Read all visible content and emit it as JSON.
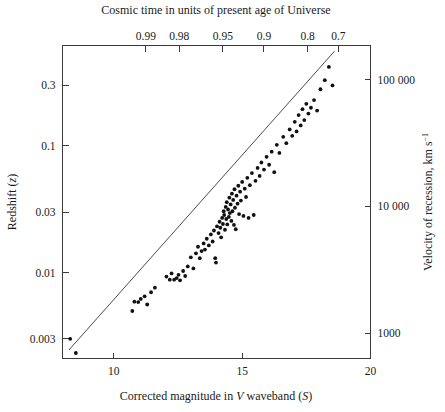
{
  "figure": {
    "width": 445,
    "height": 412,
    "background": "#ffffff",
    "point_color": "#111111",
    "line_color": "#4a4a4a",
    "axis_color": "#3a3a3a"
  },
  "chart_data": {
    "type": "scatter",
    "title": "",
    "top_axis_title": "Cosmic time in units of present age of Universe",
    "xlabel_parts": {
      "pre": "Corrected magnitude in ",
      "italic1": "V",
      "mid": " waveband (",
      "italic2": "S",
      "post": ")"
    },
    "xlabel": "Corrected magnitude in V waveband (S)",
    "ylabel_parts": {
      "pre": "Redshift (",
      "italic1": "z",
      "post": ")"
    },
    "ylabel": "Redshift (z)",
    "ylabel_right_parts": {
      "pre": "Velocity of recession, km s",
      "sup": "−1"
    },
    "ylabel_right": "Velocity of recession, km s−1",
    "grid": false,
    "legend": null,
    "xscale": "linear",
    "yscale": "log",
    "xlim": [
      8.0,
      20.0
    ],
    "ylim": [
      0.0021,
      0.62
    ],
    "xticks": [
      10,
      15,
      20
    ],
    "xticklabels": [
      "10",
      "15",
      "20"
    ],
    "yticks": [
      0.003,
      0.01,
      0.03,
      0.1,
      0.3
    ],
    "yticklabels": [
      "0.003",
      "0.01",
      "0.03",
      "0.1",
      "0.3"
    ],
    "right_yticks": [
      1000,
      10000,
      100000
    ],
    "right_yticklabels": [
      "1000",
      "10 000",
      "100 000"
    ],
    "top_ticks": [
      0.99,
      0.98,
      0.95,
      0.9,
      0.8,
      0.7
    ],
    "top_ticklabels": [
      "0.99",
      "0.98",
      "0.95",
      "0.9",
      "0.8",
      "0.7"
    ],
    "top_tick_x": [
      11.25,
      12.55,
      14.25,
      15.85,
      17.55,
      18.75
    ],
    "fit_line": {
      "x": [
        8.25,
        18.6
      ],
      "y": [
        0.00245,
        0.56
      ]
    },
    "points": [
      [
        8.3,
        0.003
      ],
      [
        8.52,
        0.00232
      ],
      [
        10.72,
        0.00498
      ],
      [
        10.8,
        0.0059
      ],
      [
        10.95,
        0.00585
      ],
      [
        11.05,
        0.0062
      ],
      [
        11.2,
        0.0065
      ],
      [
        11.3,
        0.0056
      ],
      [
        11.45,
        0.007
      ],
      [
        11.6,
        0.0076
      ],
      [
        12.05,
        0.0093
      ],
      [
        12.18,
        0.0088
      ],
      [
        12.25,
        0.00985
      ],
      [
        12.35,
        0.0088
      ],
      [
        12.45,
        0.00905
      ],
      [
        12.52,
        0.0096
      ],
      [
        12.58,
        0.0087
      ],
      [
        12.7,
        0.0103
      ],
      [
        12.78,
        0.0094
      ],
      [
        12.88,
        0.0112
      ],
      [
        13.0,
        0.0132
      ],
      [
        13.1,
        0.0108
      ],
      [
        13.2,
        0.0142
      ],
      [
        13.28,
        0.016
      ],
      [
        13.35,
        0.013
      ],
      [
        13.42,
        0.0148
      ],
      [
        13.5,
        0.017
      ],
      [
        13.55,
        0.0152
      ],
      [
        13.62,
        0.0185
      ],
      [
        13.7,
        0.0164
      ],
      [
        13.78,
        0.02
      ],
      [
        13.85,
        0.0176
      ],
      [
        13.9,
        0.0215
      ],
      [
        13.95,
        0.013
      ],
      [
        13.98,
        0.012
      ],
      [
        14.02,
        0.0232
      ],
      [
        14.08,
        0.0205
      ],
      [
        14.12,
        0.0252
      ],
      [
        14.15,
        0.0226
      ],
      [
        14.18,
        0.019
      ],
      [
        14.22,
        0.027
      ],
      [
        14.25,
        0.0242
      ],
      [
        14.28,
        0.0305
      ],
      [
        14.3,
        0.0285
      ],
      [
        14.33,
        0.0218
      ],
      [
        14.36,
        0.033
      ],
      [
        14.38,
        0.0265
      ],
      [
        14.4,
        0.036
      ],
      [
        14.42,
        0.024
      ],
      [
        14.45,
        0.0315
      ],
      [
        14.48,
        0.0275
      ],
      [
        14.5,
        0.039
      ],
      [
        14.52,
        0.0295
      ],
      [
        14.55,
        0.0345
      ],
      [
        14.58,
        0.0256
      ],
      [
        14.6,
        0.042
      ],
      [
        14.62,
        0.0305
      ],
      [
        14.65,
        0.0375
      ],
      [
        14.68,
        0.0238
      ],
      [
        14.7,
        0.0455
      ],
      [
        14.72,
        0.0325
      ],
      [
        14.75,
        0.022
      ],
      [
        14.78,
        0.0405
      ],
      [
        14.82,
        0.035
      ],
      [
        14.85,
        0.0485
      ],
      [
        14.88,
        0.029
      ],
      [
        14.92,
        0.0435
      ],
      [
        14.95,
        0.037
      ],
      [
        15.0,
        0.052
      ],
      [
        15.05,
        0.028
      ],
      [
        15.1,
        0.046
      ],
      [
        15.15,
        0.0395
      ],
      [
        15.2,
        0.056
      ],
      [
        15.25,
        0.027
      ],
      [
        15.3,
        0.049
      ],
      [
        15.38,
        0.061
      ],
      [
        15.45,
        0.0285
      ],
      [
        15.52,
        0.053
      ],
      [
        15.6,
        0.067
      ],
      [
        15.68,
        0.058
      ],
      [
        15.75,
        0.074
      ],
      [
        15.85,
        0.065
      ],
      [
        15.95,
        0.082
      ],
      [
        16.05,
        0.071
      ],
      [
        16.15,
        0.09
      ],
      [
        16.25,
        0.062
      ],
      [
        16.35,
        0.102
      ],
      [
        16.45,
        0.088
      ],
      [
        16.6,
        0.118
      ],
      [
        16.72,
        0.105
      ],
      [
        16.85,
        0.135
      ],
      [
        16.95,
        0.12
      ],
      [
        17.05,
        0.155
      ],
      [
        17.12,
        0.13
      ],
      [
        17.2,
        0.175
      ],
      [
        17.28,
        0.145
      ],
      [
        17.35,
        0.195
      ],
      [
        17.42,
        0.16
      ],
      [
        17.5,
        0.215
      ],
      [
        17.58,
        0.18
      ],
      [
        17.68,
        0.2
      ],
      [
        17.8,
        0.23
      ],
      [
        17.92,
        0.19
      ],
      [
        18.05,
        0.28
      ],
      [
        18.22,
        0.33
      ],
      [
        18.38,
        0.42
      ],
      [
        18.52,
        0.3
      ]
    ],
    "n_points": 108
  }
}
